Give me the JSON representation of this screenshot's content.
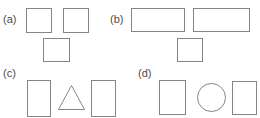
{
  "figure": {
    "width": 260,
    "height": 118,
    "background": "#ffffff",
    "stroke_color": "#858585",
    "label_color": "#4c4c4c",
    "clipped_top_text": "PROBLEMS"
  },
  "panels": [
    {
      "id": "a",
      "label": "(a)",
      "label_x": 3,
      "label_y": 14,
      "shapes": [
        {
          "name": "square",
          "type": "rect",
          "x": 26,
          "y": 8,
          "w": 26,
          "h": 25
        },
        {
          "name": "square",
          "type": "rect",
          "x": 63,
          "y": 8,
          "w": 26,
          "h": 25
        },
        {
          "name": "square",
          "type": "rect",
          "x": 43,
          "y": 38,
          "w": 27,
          "h": 24
        }
      ]
    },
    {
      "id": "b",
      "label": "(b)",
      "label_x": 110,
      "label_y": 14,
      "shapes": [
        {
          "name": "rectangle",
          "type": "rect",
          "x": 131,
          "y": 8,
          "w": 54,
          "h": 24
        },
        {
          "name": "rectangle",
          "type": "rect",
          "x": 193,
          "y": 8,
          "w": 57,
          "h": 24
        },
        {
          "name": "square",
          "type": "rect",
          "x": 177,
          "y": 38,
          "w": 26,
          "h": 24
        }
      ]
    },
    {
      "id": "c",
      "label": "(c)",
      "label_x": 3,
      "label_y": 68,
      "shapes": [
        {
          "name": "rectangle",
          "type": "rect",
          "x": 27,
          "y": 80,
          "w": 24,
          "h": 37
        },
        {
          "name": "triangle",
          "type": "tri",
          "x": 58,
          "y": 85,
          "w": 27,
          "h": 25
        },
        {
          "name": "rectangle",
          "type": "rect",
          "x": 91,
          "y": 80,
          "w": 25,
          "h": 37
        }
      ]
    },
    {
      "id": "d",
      "label": "(d)",
      "label_x": 138,
      "label_y": 68,
      "shapes": [
        {
          "name": "rectangle",
          "type": "rect",
          "x": 159,
          "y": 80,
          "w": 27,
          "h": 35
        },
        {
          "name": "circle",
          "type": "circle",
          "x": 197,
          "y": 83,
          "w": 29,
          "h": 29
        },
        {
          "name": "rectangle",
          "type": "rect",
          "x": 232,
          "y": 81,
          "w": 25,
          "h": 34
        }
      ]
    }
  ]
}
